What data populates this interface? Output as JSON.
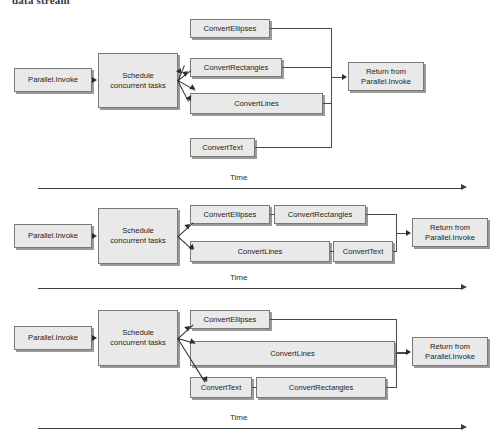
{
  "page": {
    "running_heading": "data stream",
    "background_color": "#ffffff",
    "box_fill": "#e9e9e9",
    "box_border": "#7a7a7a",
    "box_shadow": "#9a9a9a",
    "line_color": "#3d3d3d"
  },
  "labels": {
    "parallel_invoke": "Parallel.Invoke",
    "schedule": "Schedule\nconcurrent tasks",
    "convert_ellipses": "ConvertEllipses",
    "convert_rectangles": "ConvertRectangles",
    "convert_lines": "ConvertLines",
    "convert_text": "ConvertText",
    "return_from": "Return from\nParallel.Invoke",
    "time": "Time"
  },
  "diagrams": [
    {
      "id": "diagram-1",
      "caption": "Time",
      "nodes": [
        {
          "name": "parallel-invoke",
          "label": "Parallel.Invoke"
        },
        {
          "name": "schedule-concurrent-tasks",
          "label": "Schedule concurrent tasks"
        },
        {
          "name": "convert-ellipses",
          "label": "ConvertEllipses"
        },
        {
          "name": "convert-rectangles",
          "label": "ConvertRectangles"
        },
        {
          "name": "convert-lines",
          "label": "ConvertLines"
        },
        {
          "name": "convert-text",
          "label": "ConvertText"
        },
        {
          "name": "return-from-parallel-invoke",
          "label": "Return from Parallel.Invoke"
        }
      ]
    },
    {
      "id": "diagram-2",
      "caption": "Time",
      "nodes": [
        {
          "name": "parallel-invoke",
          "label": "Parallel.Invoke"
        },
        {
          "name": "schedule-concurrent-tasks",
          "label": "Schedule concurrent tasks"
        },
        {
          "name": "convert-ellipses",
          "label": "ConvertEllipses"
        },
        {
          "name": "convert-rectangles",
          "label": "ConvertRectangles"
        },
        {
          "name": "convert-lines",
          "label": "ConvertLines"
        },
        {
          "name": "convert-text",
          "label": "ConvertText"
        },
        {
          "name": "return-from-parallel-invoke",
          "label": "Return from Parallel.Invoke"
        }
      ]
    },
    {
      "id": "diagram-3",
      "caption": "Time",
      "nodes": [
        {
          "name": "parallel-invoke",
          "label": "Parallel.Invoke"
        },
        {
          "name": "schedule-concurrent-tasks",
          "label": "Schedule concurrent tasks"
        },
        {
          "name": "convert-ellipses",
          "label": "ConvertEllipses"
        },
        {
          "name": "convert-lines",
          "label": "ConvertLines"
        },
        {
          "name": "convert-text",
          "label": "ConvertText"
        },
        {
          "name": "convert-rectangles",
          "label": "ConvertRectangles"
        },
        {
          "name": "return-from-parallel-invoke",
          "label": "Return from Parallel.Invoke"
        }
      ]
    }
  ]
}
